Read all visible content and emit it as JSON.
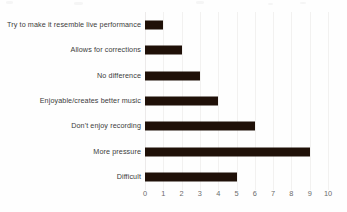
{
  "chart_data": {
    "type": "bar",
    "orientation": "horizontal",
    "title": "",
    "subtitle": "",
    "xlabel": "",
    "ylabel": "",
    "categories": [
      "Try to make it resemble live performance",
      "Allows for corrections",
      "No difference",
      "Enjoyable/creates better music",
      "Don't enjoy recording",
      "More pressure",
      "Difficult"
    ],
    "values": [
      1,
      2,
      3,
      4,
      6,
      9,
      5
    ],
    "xlim": [
      0,
      10
    ],
    "xticks": [
      "0",
      "1",
      "2",
      "3",
      "4",
      "5",
      "6",
      "7",
      "8",
      "9",
      "10"
    ],
    "xtick_step": 1,
    "grid": "vertical-light",
    "legend": "none",
    "bar_color": "#1f1008",
    "gridline_color": "#f2f1f0",
    "label_color": "#3b3b3b",
    "tick_color": "#6c6c6c",
    "background_color": "#fefefe"
  }
}
